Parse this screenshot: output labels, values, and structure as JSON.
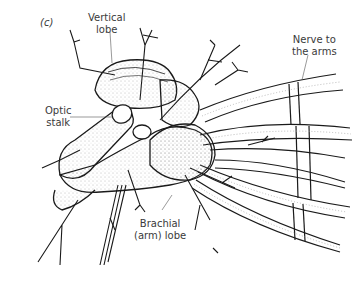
{
  "figure": {
    "panel_label": "(c)",
    "labels": {
      "vertical_lobe": [
        "Vertical",
        "lobe"
      ],
      "optic_stalk": [
        "Optic",
        "stalk"
      ],
      "brachial_lobe": [
        "Brachial",
        "(arm) lobe"
      ],
      "nerve_to_arms": [
        "Nerve to",
        "the arms"
      ]
    },
    "colors": {
      "line": "#1a1a1a",
      "stipple": "#888888",
      "text": "#3a3a3a",
      "background": "#ffffff"
    }
  }
}
